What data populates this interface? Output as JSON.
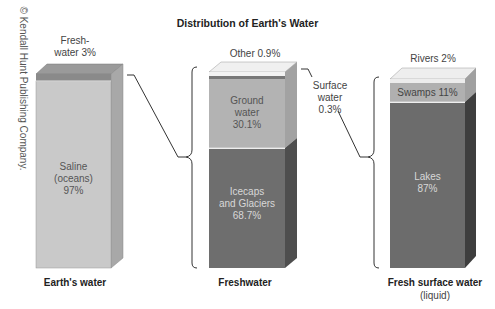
{
  "title": "Distribution of Earth's Water",
  "copyright": "© Kendall Hunt Publishing Company.",
  "colors": {
    "saline": "#c9c9c9",
    "fresh_band": "#8a8a8a",
    "ground_water": "#b3b3b3",
    "icecaps": "#6e6e6e",
    "other": "#f2f2f2",
    "surface_band": "#777777",
    "rivers": "#ececec",
    "swamps": "#b0b0b0",
    "lakes": "#6c6c6c"
  },
  "bars": [
    {
      "caption": "Earth's water",
      "segments": [
        {
          "label": "Fresh-\nwater 3%",
          "name": "Freshwater",
          "percent": 3
        },
        {
          "label": "Saline\n(oceans)\n97%",
          "name": "Saline (oceans)",
          "percent": 97
        }
      ]
    },
    {
      "caption": "Freshwater",
      "segments": [
        {
          "label": "Other 0.9%",
          "name": "Other",
          "percent": 0.9
        },
        {
          "label": "Surface\nwater\n0.3%",
          "name": "Surface water",
          "percent": 0.3
        },
        {
          "label": "Ground\nwater\n30.1%",
          "name": "Ground water",
          "percent": 30.1
        },
        {
          "label": "Icecaps\nand Glaciers\n68.7%",
          "name": "Icecaps and Glaciers",
          "percent": 68.7
        }
      ]
    },
    {
      "caption": "Fresh surface water",
      "subcaption": "(liquid)",
      "segments": [
        {
          "label": "Rivers 2%",
          "name": "Rivers",
          "percent": 2
        },
        {
          "label": "Swamps 11%",
          "name": "Swamps",
          "percent": 11
        },
        {
          "label": "Lakes\n87%",
          "name": "Lakes",
          "percent": 87
        }
      ]
    }
  ],
  "labels": {
    "freshwater_3": [
      "Fresh-",
      "water 3%"
    ],
    "saline": [
      "Saline",
      "(oceans)",
      "97%"
    ],
    "other": "Other 0.9%",
    "ground": [
      "Ground",
      "water",
      "30.1%"
    ],
    "surface": [
      "Surface",
      "water",
      "0.3%"
    ],
    "icecaps": [
      "Icecaps",
      "and Glaciers",
      "68.7%"
    ],
    "rivers": "Rivers 2%",
    "swamps": "Swamps 11%",
    "lakes": [
      "Lakes",
      "87%"
    ],
    "cap1": "Earth's water",
    "cap2": "Freshwater",
    "cap3": "Fresh surface water",
    "cap3_sub": "(liquid)"
  }
}
